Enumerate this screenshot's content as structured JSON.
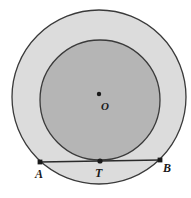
{
  "figure": {
    "kind": "geometry-diagram",
    "canvas": {
      "width": 191,
      "height": 198,
      "background": "#ffffff"
    },
    "colors": {
      "outer_fill": "#dcdcdc",
      "inner_fill": "#b5b5b5",
      "stroke": "#3a3a3a",
      "chord_stroke": "#2b2b2b",
      "point_fill": "#1a1a1a",
      "label_color": "#1a1a1a"
    },
    "shapes": {
      "outer_circle": {
        "name": "outer-circle",
        "cx": 99,
        "cy": 97,
        "r": 87,
        "stroke_width": 1.3
      },
      "inner_circle": {
        "name": "inner-circle",
        "cx": 100,
        "cy": 100,
        "r": 60,
        "stroke_width": 1.3
      }
    },
    "chord": {
      "name": "chord-AB",
      "from": {
        "x": 40,
        "y": 162
      },
      "to": {
        "x": 160,
        "y": 160
      },
      "stroke_width": 1.6,
      "tangent_point": {
        "x": 100,
        "y": 161
      }
    },
    "points": [
      {
        "id": "A",
        "label": "A",
        "x": 40,
        "y": 162,
        "marker": "square",
        "size": 3.4
      },
      {
        "id": "T",
        "label": "T",
        "x": 100,
        "y": 161,
        "marker": "dot",
        "size": 2.6
      },
      {
        "id": "B",
        "label": "B",
        "x": 160,
        "y": 160,
        "marker": "square",
        "size": 3.4
      },
      {
        "id": "O",
        "label": "O",
        "x": 99,
        "y": 94,
        "marker": "dot",
        "size": 2.2
      }
    ],
    "labels": {
      "A": "A",
      "T": "T",
      "B": "B",
      "O": "O"
    }
  }
}
